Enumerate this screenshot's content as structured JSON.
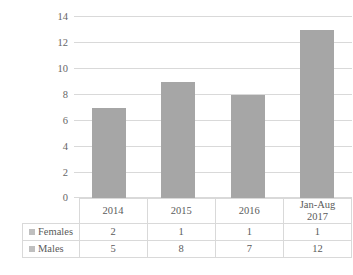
{
  "chart_data": {
    "type": "bar",
    "title": "",
    "subtitle": "",
    "xlabel": "",
    "ylabel": "",
    "categories": [
      "2014",
      "2015",
      "2016",
      "Jan-Aug 2017"
    ],
    "category_lines": [
      [
        "2014"
      ],
      [
        "2015"
      ],
      [
        "2016"
      ],
      [
        "Jan-Aug",
        "2017"
      ]
    ],
    "values": [
      7,
      9,
      8,
      13
    ],
    "note": "Plotted bars show the total (Males + Females) for each period.",
    "series": [
      {
        "name": "Females",
        "values": [
          2,
          1,
          1,
          1
        ]
      },
      {
        "name": "Males",
        "values": [
          5,
          8,
          7,
          12
        ]
      }
    ],
    "ylim": [
      0,
      14
    ],
    "yticks": [
      0,
      2,
      4,
      6,
      8,
      10,
      12,
      14
    ],
    "ytick_labels": [
      "0",
      "2",
      "4",
      "6",
      "8",
      "10",
      "12",
      "14"
    ],
    "grid": true,
    "legend_position": "data-table-left",
    "bar_color": "#a6a6a6",
    "gridline_color": "#d9d9d9",
    "legend_marker_color": "#bfbfbf",
    "table_border_color": "#d9d9d9",
    "background_color": "#ffffff",
    "text_color": "#5b5b5b"
  },
  "data_table": {
    "column_headers": [
      "",
      "2014",
      "2015",
      "2016",
      "Jan-Aug 2017"
    ],
    "rows": [
      {
        "label": "Females",
        "cells": [
          "2",
          "1",
          "1",
          "1"
        ]
      },
      {
        "label": "Males",
        "cells": [
          "5",
          "8",
          "7",
          "12"
        ]
      }
    ]
  }
}
